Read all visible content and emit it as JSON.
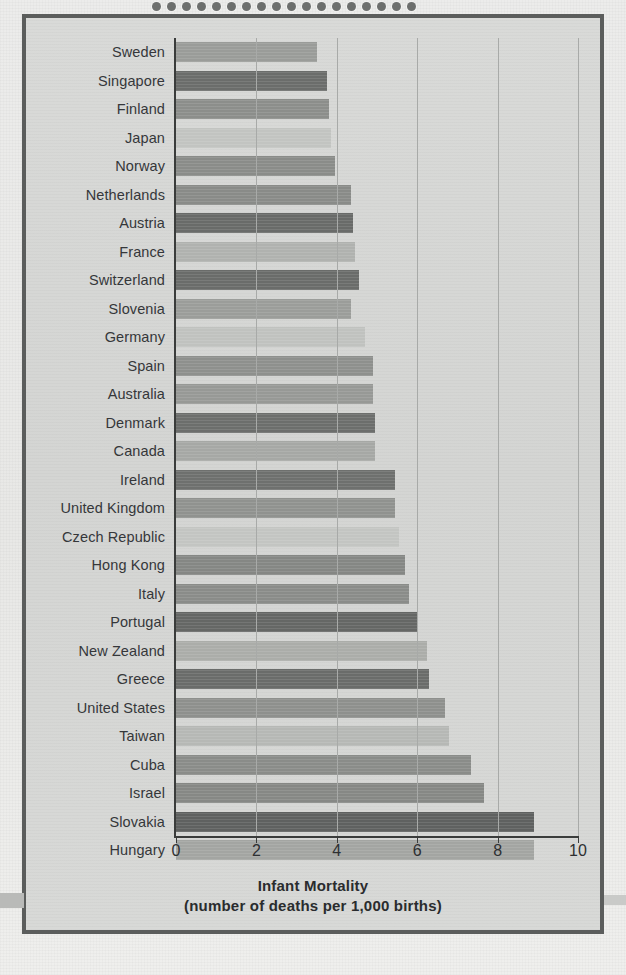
{
  "figure": {
    "background_color": "#d7d8d6",
    "frame_color": "#5b5d5c",
    "binding_holes": 18
  },
  "chart_data": {
    "type": "bar",
    "orientation": "horizontal",
    "title": "",
    "xlabel": "Infant Mortality",
    "xlabel_sub": "(number of deaths per 1,000 births)",
    "ylabel": "",
    "xlim": [
      0,
      10
    ],
    "xticks": [
      0,
      2,
      4,
      6,
      8,
      10
    ],
    "xtick_labels": [
      "0",
      "2",
      "4",
      "6",
      "8",
      "10"
    ],
    "grid": "vertical",
    "legend": "none",
    "categories": [
      "Sweden",
      "Singapore",
      "Finland",
      "Japan",
      "Norway",
      "Netherlands",
      "Austria",
      "France",
      "Switzerland",
      "Slovenia",
      "Germany",
      "Spain",
      "Australia",
      "Denmark",
      "Canada",
      "Ireland",
      "United Kingdom",
      "Czech Republic",
      "Hong Kong",
      "Italy",
      "Portugal",
      "New Zealand",
      "Greece",
      "United States",
      "Taiwan",
      "Cuba",
      "Israel",
      "Slovakia",
      "Hungary"
    ],
    "values": [
      3.5,
      3.75,
      3.8,
      3.85,
      3.95,
      4.35,
      4.4,
      4.45,
      4.55,
      4.35,
      4.7,
      4.9,
      4.9,
      4.95,
      4.95,
      5.45,
      5.45,
      5.55,
      5.7,
      5.8,
      6.0,
      6.25,
      6.3,
      6.7,
      6.8,
      7.35,
      7.65,
      8.9,
      8.9
    ],
    "bar_colors": [
      "#9a9c99",
      "#6b6d6b",
      "#8c8e8b",
      "#c2c4c1",
      "#8a8c89",
      "#898b88",
      "#696b69",
      "#b0b2af",
      "#6a6c6a",
      "#9b9d9a",
      "#c0c2bf",
      "#8e908d",
      "#979996",
      "#6c6e6c",
      "#a6a8a5",
      "#6e706e",
      "#90928f",
      "#c3c5c2",
      "#858784",
      "#8a8c89",
      "#656765",
      "#abada9",
      "#6a6c6a",
      "#8e908d",
      "#b6b8b5",
      "#8a8c89",
      "#868885",
      "#5f6160",
      "#a3a5a2"
    ]
  }
}
